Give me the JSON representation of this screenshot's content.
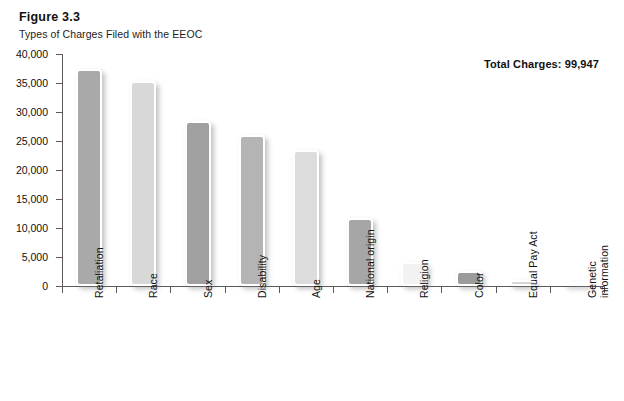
{
  "header": {
    "figure_number": "Figure 3.3",
    "title": "Types of Charges Filed with the EEOC",
    "total_label": "Total Charges: 99,947"
  },
  "chart_data": {
    "type": "bar",
    "title": "Types of Charges Filed with the EEOC",
    "xlabel": "",
    "ylabel": "",
    "ylim": [
      0,
      40000
    ],
    "grid": false,
    "legend": "none",
    "categories": [
      "Retaliation",
      "Race",
      "Sex",
      "Disability",
      "Age",
      "National origin",
      "Religion",
      "Color",
      "Equal Pay Act",
      "Genetic information"
    ],
    "values": [
      37400,
      35400,
      28400,
      26000,
      23400,
      11800,
      4100,
      2600,
      1000,
      400
    ],
    "ytick_labels": [
      "40,000",
      "35,000",
      "30,000",
      "25,000",
      "20,000",
      "15,000",
      "10,000",
      "5,000",
      "0"
    ],
    "ytick_values": [
      40000,
      35000,
      30000,
      25000,
      20000,
      15000,
      10000,
      5000,
      0
    ],
    "bar_colors": [
      "#a9a9a9",
      "#d8d8d8",
      "#a0a0a0",
      "#b4b4b4",
      "#dcdcdc",
      "#a6a6a6",
      "#f2f2f2",
      "#9b9b9b",
      "#d5d5d5",
      "#e2e2e2"
    ],
    "total_charges": 99947
  },
  "colors": {
    "axis": "#5a5a5a",
    "text": "#111111",
    "background": "#ffffff"
  }
}
